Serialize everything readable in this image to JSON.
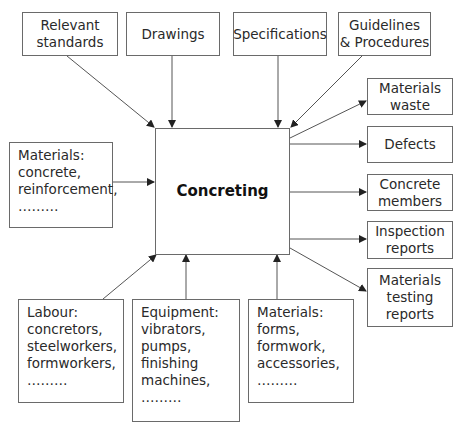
{
  "center": {
    "label": "Concreting"
  },
  "top_inputs": [
    {
      "lines": [
        "Relevant",
        "standards"
      ]
    },
    {
      "lines": [
        "Drawings"
      ]
    },
    {
      "lines": [
        "Specifications"
      ]
    },
    {
      "lines": [
        "Guidelines",
        "& Procedures"
      ]
    }
  ],
  "left_input": {
    "lines": [
      "Materials:",
      "concrete,",
      "reinforcement,",
      "………"
    ]
  },
  "bottom_inputs": [
    {
      "lines": [
        "Labour:",
        "concretors,",
        "steelworkers,",
        "formworkers,",
        "………"
      ]
    },
    {
      "lines": [
        "Equipment:",
        "vibrators,",
        "pumps,",
        "finishing",
        "machines,",
        "………"
      ]
    },
    {
      "lines": [
        "Materials:",
        "forms,",
        "formwork,",
        "accessories,",
        "………"
      ]
    }
  ],
  "outputs": [
    {
      "lines": [
        "Materials",
        "waste"
      ]
    },
    {
      "lines": [
        "Defects"
      ]
    },
    {
      "lines": [
        "Concrete",
        "members"
      ]
    },
    {
      "lines": [
        "Inspection",
        "reports"
      ]
    },
    {
      "lines": [
        "Materials",
        "testing",
        "reports"
      ]
    }
  ],
  "colors": {
    "line": "#555555",
    "border": "#6a6a6a",
    "text": "#2a2a2a"
  }
}
